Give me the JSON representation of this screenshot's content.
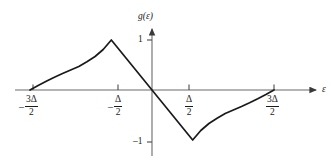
{
  "figure": {
    "background_color": "#ffffff",
    "ink_color": "#1a1a1a",
    "axis_color": "#555555",
    "curve_color": "#1a1a1a"
  },
  "axes": {
    "y_axis_label": "g(ε)",
    "x_axis_label": "ε",
    "y_ticks": [
      {
        "label": "1",
        "value": 1
      },
      {
        "label": "–1",
        "value": -1
      }
    ],
    "x_ticks": [
      {
        "minus": "–",
        "numerator": "3Δ",
        "denominator": "2",
        "label": "–3Δ/2",
        "value": -1.5
      },
      {
        "minus": "–",
        "numerator": "Δ",
        "denominator": "2",
        "label": "–Δ/2",
        "value": -0.5
      },
      {
        "minus": "",
        "numerator": "Δ",
        "denominator": "2",
        "label": "Δ/2",
        "value": 0.5
      },
      {
        "minus": "",
        "numerator": "3Δ",
        "denominator": "2",
        "label": "3Δ/2",
        "value": 1.5
      }
    ]
  },
  "chart_data": {
    "type": "line",
    "title": "",
    "xlabel": "ε",
    "ylabel": "g(ε)",
    "xlim": [
      -1.5,
      1.5
    ],
    "ylim": [
      -1,
      1
    ],
    "grid": false,
    "legend": null,
    "x_unit": "Δ",
    "x_tick_labels": [
      "–3Δ/2",
      "–Δ/2",
      "Δ/2",
      "3Δ/2"
    ],
    "x_tick_values": [
      -1.5,
      -0.5,
      0.5,
      1.5
    ],
    "y_tick_labels": [
      "1",
      "–1"
    ],
    "y_tick_values": [
      1,
      -1
    ],
    "series": [
      {
        "name": "g(ε)",
        "x": [
          -1.5,
          -1.4,
          -1.3,
          -1.2,
          -1.1,
          -1.0,
          -0.9,
          -0.8,
          -0.7,
          -0.6,
          -0.5,
          -0.4,
          -0.3,
          -0.2,
          -0.1,
          0.0,
          0.1,
          0.2,
          0.3,
          0.4,
          0.5,
          0.6,
          0.7,
          0.8,
          0.9,
          1.0,
          1.1,
          1.2,
          1.3,
          1.4,
          1.5
        ],
        "y": [
          0.0,
          0.09,
          0.175,
          0.255,
          0.33,
          0.4,
          0.47,
          0.565,
          0.67,
          0.81,
          1.0,
          0.8,
          0.6,
          0.4,
          0.2,
          0.0,
          -0.2,
          -0.4,
          -0.6,
          -0.8,
          -1.0,
          -0.81,
          -0.67,
          -0.565,
          -0.47,
          -0.4,
          -0.33,
          -0.255,
          -0.175,
          -0.09,
          0.0
        ]
      }
    ]
  }
}
